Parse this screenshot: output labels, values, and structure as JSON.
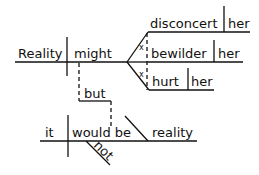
{
  "diagram": {
    "type": "Reed-Kellogg sentence diagram",
    "clause1": {
      "subject": "Reality",
      "verb": "might",
      "compound_predicates": [
        {
          "verb": "disconcert",
          "object": "her"
        },
        {
          "verb": "bewilder",
          "object": "her"
        },
        {
          "verb": "hurt",
          "object": "her"
        }
      ],
      "connector_marks": [
        "x",
        "x"
      ]
    },
    "conjunction": "but",
    "clause2": {
      "subject": "it",
      "verb": "would be",
      "modifier": "not",
      "predicate_nominative": "reality"
    },
    "colors": {
      "ink": "#111111",
      "background": "#ffffff"
    }
  }
}
